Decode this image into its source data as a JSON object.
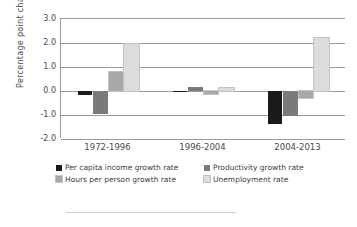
{
  "chart_data": {
    "type": "bar",
    "title": "",
    "xlabel": "",
    "ylabel": "Percentage point change",
    "categories": [
      "1972-1996",
      "1996-2004",
      "2004-2013"
    ],
    "ylim": [
      -2.0,
      3.0
    ],
    "yticks": [
      3.0,
      2.0,
      1.0,
      0.0,
      -1.0,
      -2.0
    ],
    "ytick_labels": [
      "3.0",
      "2.0",
      "1.0",
      "0.0",
      "-1.0",
      "-2.0"
    ],
    "grid": true,
    "legend_position": "bottom",
    "series": [
      {
        "name": "Per capita income growth rate",
        "color": "#1a1a1a",
        "values": [
          -0.15,
          -0.03,
          -1.38
        ]
      },
      {
        "name": "Productivity growth rate",
        "color": "#7a7a7a",
        "values": [
          -0.95,
          0.15,
          -1.05
        ]
      },
      {
        "name": "Hours per person growth rate",
        "color": "#a8a8a8",
        "values": [
          0.78,
          -0.12,
          -0.3
        ]
      },
      {
        "name": "Unemployment rate",
        "color": "#dcdcdc",
        "values": [
          1.95,
          0.12,
          2.2
        ]
      }
    ]
  },
  "axis": {
    "y_title": "Percentage point change"
  },
  "legend": {
    "items": [
      {
        "label": "Per capita income growth rate",
        "color": "#1a1a1a"
      },
      {
        "label": "Productivity growth rate",
        "color": "#7a7a7a"
      },
      {
        "label": "Hours per person growth rate",
        "color": "#a8a8a8"
      },
      {
        "label": "Unemployment rate",
        "color": "#dcdcdc"
      }
    ]
  }
}
